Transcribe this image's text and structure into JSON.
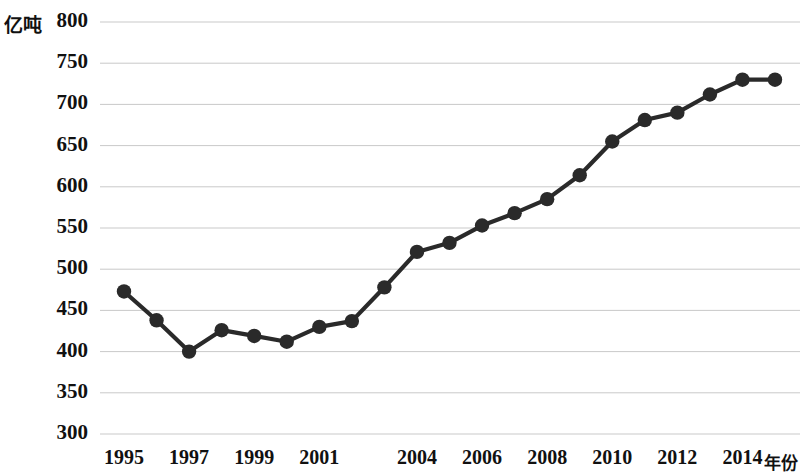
{
  "chart_data": {
    "type": "line",
    "title": "",
    "xlabel": "年份",
    "ylabel": "亿吨",
    "ylim": [
      300,
      800
    ],
    "yticks": [
      300,
      350,
      400,
      450,
      500,
      550,
      600,
      650,
      700,
      750,
      800
    ],
    "xtick_labels": [
      "1995",
      "1997",
      "1999",
      "2001",
      "2004",
      "2006",
      "2008",
      "2010",
      "2012",
      "2014"
    ],
    "xtick_years": [
      1995,
      1997,
      1999,
      2001,
      2004,
      2006,
      2008,
      2010,
      2012,
      2014
    ],
    "grid": true,
    "legend": "none",
    "marker": "filled-circle",
    "series_color": "#2a2a2a",
    "grid_color": "#c9c9c9",
    "x": [
      1995,
      1996,
      1997,
      1998,
      1999,
      2000,
      2001,
      2002,
      2003,
      2004,
      2005,
      2006,
      2007,
      2008,
      2009,
      2010,
      2011,
      2012,
      2013,
      2014,
      2015
    ],
    "categories": [
      "1995",
      "1996",
      "1997",
      "1998",
      "1999",
      "2000",
      "2001",
      "2002",
      "2003",
      "2004",
      "2005",
      "2006",
      "2007",
      "2008",
      "2009",
      "2010",
      "2011",
      "2012",
      "2013",
      "2014",
      "2015"
    ],
    "values": [
      473,
      438,
      400,
      426,
      419,
      412,
      430,
      437,
      478,
      521,
      532,
      553,
      568,
      585,
      614,
      655,
      681,
      690,
      712,
      730,
      730
    ],
    "series": [
      {
        "name": "亿吨",
        "values": [
          473,
          438,
          400,
          426,
          419,
          412,
          430,
          437,
          478,
          521,
          532,
          553,
          568,
          585,
          614,
          655,
          681,
          690,
          712,
          730,
          730
        ]
      }
    ]
  },
  "axes": {
    "unit_label": "亿吨",
    "x_axis_title": "年份"
  }
}
